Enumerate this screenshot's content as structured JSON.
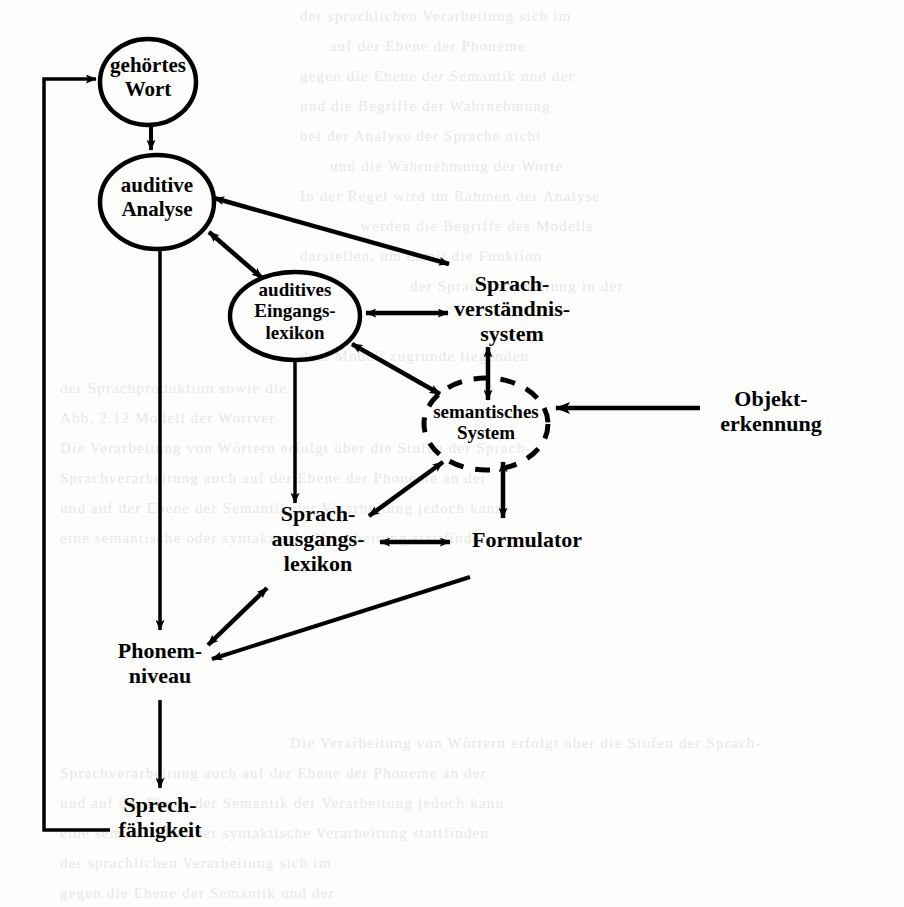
{
  "page": {
    "width": 904,
    "height": 907,
    "background_color": "#fdfdfc",
    "ink_color": "#000000",
    "caption": ""
  },
  "diagram": {
    "type": "flow-diagram",
    "language": "de",
    "nodes": [
      {
        "id": "gehoertes-wort",
        "label": "gehörtes\nWort",
        "shape": "ellipse",
        "border": "solid",
        "cx": 148,
        "cy": 82,
        "rx": 48,
        "ry": 43
      },
      {
        "id": "auditive-analyse",
        "label": "auditive\nAnalyse",
        "shape": "ellipse",
        "border": "solid",
        "cx": 157,
        "cy": 202,
        "rx": 57,
        "ry": 47
      },
      {
        "id": "auditives-eingangslexikon",
        "label": "auditives\nEingangs-\nlexikon",
        "shape": "ellipse",
        "border": "solid",
        "cx": 295,
        "cy": 316,
        "rx": 65,
        "ry": 44
      },
      {
        "id": "sprachverstaendnissystem",
        "label": "Sprach-\nverständnis-\nsystem",
        "shape": "none",
        "border": "none",
        "cx": 512,
        "cy": 313,
        "rx": 0,
        "ry": 0
      },
      {
        "id": "semantisches-system",
        "label": "semantisches\nSystem",
        "shape": "ellipse",
        "border": "dashed",
        "cx": 486,
        "cy": 424,
        "rx": 62,
        "ry": 46
      },
      {
        "id": "objekterkennung",
        "label": "Objekt-\nerkennung",
        "shape": "none",
        "border": "none",
        "cx": 771,
        "cy": 413,
        "rx": 0,
        "ry": 0
      },
      {
        "id": "sprachausgangslexikon",
        "label": "Sprach-\nausgangs-\nlexikon",
        "shape": "none",
        "border": "none",
        "cx": 318,
        "cy": 539,
        "rx": 0,
        "ry": 0
      },
      {
        "id": "formulator",
        "label": "Formulator",
        "shape": "none",
        "border": "none",
        "cx": 507,
        "cy": 540,
        "rx": 0,
        "ry": 0
      },
      {
        "id": "phonemniveau",
        "label": "Phonem-\nniveau",
        "shape": "none",
        "border": "none",
        "cx": 156,
        "cy": 664,
        "rx": 0,
        "ry": 0
      },
      {
        "id": "sprechfaehigkeit",
        "label": "Sprech-\nfähigkeit",
        "shape": "none",
        "border": "none",
        "cx": 157,
        "cy": 818,
        "rx": 0,
        "ry": 0
      }
    ],
    "edges": [
      {
        "id": "e1",
        "from": "gehoertes-wort",
        "to": "auditive-analyse",
        "direction": "one-way"
      },
      {
        "id": "e2",
        "from": "auditive-analyse",
        "to": "auditives-eingangslexikon",
        "direction": "two-way"
      },
      {
        "id": "e3",
        "from": "auditive-analyse",
        "to": "sprachverstaendnissystem",
        "direction": "two-way"
      },
      {
        "id": "e4",
        "from": "auditives-eingangslexikon",
        "to": "sprachverstaendnissystem",
        "direction": "two-way"
      },
      {
        "id": "e5",
        "from": "auditives-eingangslexikon",
        "to": "semantisches-system",
        "direction": "two-way"
      },
      {
        "id": "e6",
        "from": "sprachverstaendnissystem",
        "to": "semantisches-system",
        "direction": "two-way"
      },
      {
        "id": "e7",
        "from": "objekterkennung",
        "to": "semantisches-system",
        "direction": "one-way"
      },
      {
        "id": "e8",
        "from": "semantisches-system",
        "to": "sprachausgangslexikon",
        "direction": "two-way"
      },
      {
        "id": "e9",
        "from": "semantisches-system",
        "to": "formulator",
        "direction": "two-way"
      },
      {
        "id": "e10",
        "from": "auditives-eingangslexikon",
        "to": "sprachausgangslexikon",
        "direction": "one-way"
      },
      {
        "id": "e11",
        "from": "sprachausgangslexikon",
        "to": "formulator",
        "direction": "two-way"
      },
      {
        "id": "e12",
        "from": "sprachausgangslexikon",
        "to": "phonemniveau",
        "direction": "two-way"
      },
      {
        "id": "e13",
        "from": "formulator",
        "to": "phonemniveau",
        "direction": "one-way"
      },
      {
        "id": "e14",
        "from": "auditive-analyse",
        "to": "phonemniveau",
        "direction": "one-way"
      },
      {
        "id": "e15",
        "from": "phonemniveau",
        "to": "sprechfaehigkeit",
        "direction": "one-way"
      },
      {
        "id": "e16",
        "from": "sprechfaehigkeit",
        "to": "gehoertes-wort",
        "direction": "one-way",
        "routing": "left-margin-loop"
      }
    ]
  },
  "background_ghost_text": [
    "der sprachlichen Verarbeitung sich im",
    "auf der Ebene der Phoneme",
    "gegen die Ebene der Semantik und der",
    "und die Begriffe der Wahrnehmung",
    "bei der Analyse der Sprache nicht",
    "und die Wahrnehmung der Worte",
    "In der Regel wird im Rahmen der Analyse",
    "werden die Begriffe des Modells",
    "darstellen, um damit die Funktion",
    "der Sprachverarbeitung in der",
    "dem Modell zugrunde liegenden",
    "der Sprachproduktion sowie die",
    "Abb. 2.12 Modell der Wortver",
    "Die Verarbeitung von Wörtern erfolgt über die Stufen der Sprach-",
    "Sprachverarbeitung auch auf der Ebene der Phoneme an der",
    "und auf der Ebene der Semantik der Verarbeitung jedoch kann",
    "eine semantische oder syntaktische Verarbeitung stattfinden"
  ]
}
